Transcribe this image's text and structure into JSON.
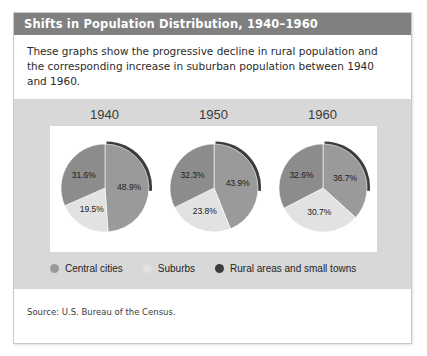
{
  "card": {
    "title": "Shifts in Population Distribution, 1940–1960",
    "intro": "These graphs show the progressive decline in rural population and the corresponding increase in suburban population between 1940 and 1960.",
    "source": "Source: U.S. Bureau of the Census."
  },
  "colors": {
    "title_bar": "#808080",
    "panel_bg": "#d8d8d8",
    "plot_bg": "#ffffff",
    "central_cities": "#9a9a9a",
    "suburbs": "#e2e2e2",
    "rural": "#4a4a4a",
    "card_border": "#c9c9c9"
  },
  "legend": {
    "items": [
      {
        "label": "Central cities",
        "color": "#9a9a9a",
        "key": "central_cities"
      },
      {
        "label": "Suburbs",
        "color": "#e2e2e2",
        "key": "suburbs"
      },
      {
        "label": "Rural areas and small towns",
        "color": "#3c3c3c",
        "key": "rural"
      }
    ]
  },
  "chart_data": {
    "type": "pie",
    "title": "Shifts in Population Distribution, 1940–1960",
    "subtitle": "These graphs show the progressive decline in rural population and the corresponding increase in suburban population between 1940 and 1960.",
    "source": "Source: U.S. Bureau of the Census.",
    "legend_position": "bottom",
    "legend_entries": [
      "Central cities",
      "Suburbs",
      "Rural areas and small towns"
    ],
    "series_names": [
      "Central cities",
      "Suburbs",
      "Rural areas and small towns"
    ],
    "charts": [
      {
        "title": "1940",
        "labels": [
          "Central cities",
          "Suburbs",
          "Rural areas and small towns"
        ],
        "values": [
          48.9,
          19.5,
          31.6
        ],
        "value_labels": [
          "48.9%",
          "19.5%",
          "31.6%"
        ],
        "colors": [
          "#9a9a9a",
          "#e2e2e2",
          "#8c8c8c"
        ]
      },
      {
        "title": "1950",
        "labels": [
          "Central cities",
          "Suburbs",
          "Rural areas and small towns"
        ],
        "values": [
          43.9,
          23.8,
          32.3
        ],
        "value_labels": [
          "43.9%",
          "23.8%",
          "32.3%"
        ],
        "colors": [
          "#9a9a9a",
          "#e2e2e2",
          "#8c8c8c"
        ]
      },
      {
        "title": "1960",
        "labels": [
          "Central cities",
          "Suburbs",
          "Rural areas and small towns"
        ],
        "values": [
          36.7,
          30.7,
          32.6
        ],
        "value_labels": [
          "36.7%",
          "30.7%",
          "32.6%"
        ],
        "colors": [
          "#9a9a9a",
          "#e2e2e2",
          "#8c8c8c"
        ]
      }
    ]
  }
}
